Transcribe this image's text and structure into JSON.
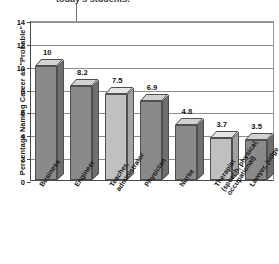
{
  "caption": {
    "text": "today's students.",
    "note": "clipped-title-line"
  },
  "axes": {
    "y_title": "Percentage Naming Career as \"Probable\"",
    "y_ticks": [
      "14",
      "12",
      "10",
      "8",
      "6",
      "4",
      "2",
      "0"
    ]
  },
  "chart_data": {
    "type": "bar",
    "title": "today's students.",
    "xlabel": "",
    "ylabel": "Percentage Naming Career as \"Probable\"",
    "ylim": [
      0,
      14
    ],
    "yticks": [
      0,
      2,
      4,
      6,
      8,
      10,
      12,
      14
    ],
    "grid": true,
    "legend": "none",
    "categories": [
      "Business",
      "Engineer",
      "Teacher, administrator",
      "Physician",
      "Nurse",
      "Therapist (speech, physical, occupational)",
      "Lawyer, judge"
    ],
    "values": [
      10,
      8.2,
      7.5,
      6.9,
      4.8,
      3.7,
      3.5
    ],
    "value_labels": [
      "10",
      "8.2",
      "7.5",
      "6.9",
      "4.8",
      "3.7",
      "3.5"
    ],
    "bar_shades": [
      "dark",
      "dark",
      "light",
      "dark",
      "dark",
      "light",
      "dark"
    ]
  },
  "bars": [
    {
      "label_lines": [
        "Business"
      ],
      "value_label": "10"
    },
    {
      "label_lines": [
        "Engineer"
      ],
      "value_label": "8.2"
    },
    {
      "label_lines": [
        "Teacher,",
        "administrator"
      ],
      "value_label": "7.5"
    },
    {
      "label_lines": [
        "Physician"
      ],
      "value_label": "6.9"
    },
    {
      "label_lines": [
        "Nurse"
      ],
      "value_label": "4.8"
    },
    {
      "label_lines": [
        "Therapist",
        "(speech, physical,",
        "occupational)"
      ],
      "value_label": "3.7"
    },
    {
      "label_lines": [
        "Lawyer, judge"
      ],
      "value_label": "3.5"
    }
  ],
  "colors": {
    "bar_dark_front": "#8a8a8a",
    "bar_dark_top": "#d2d2d2",
    "bar_dark_side": "#6f6f6f",
    "bar_light_front": "#c0c0c0",
    "bar_light_top": "#e4e4e4",
    "bar_light_side": "#a3a3a3",
    "axis": "#4a4a4a",
    "grid": "#8d8d8d",
    "text": "#141414",
    "background": "#ffffff"
  }
}
